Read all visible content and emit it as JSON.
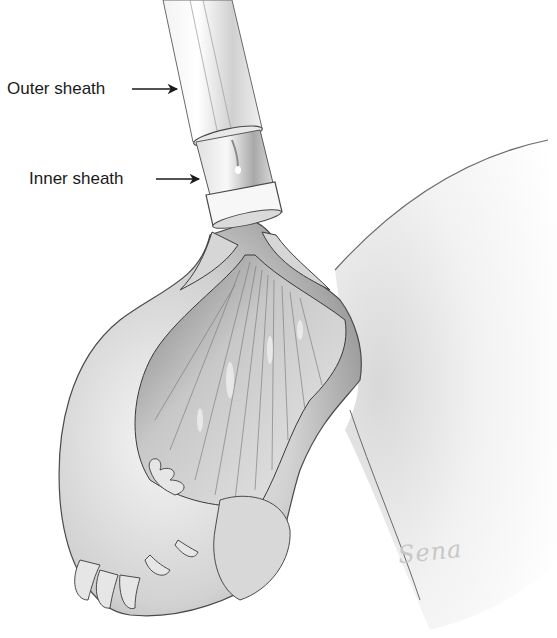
{
  "figure": {
    "labels": [
      {
        "id": "outer",
        "text": "Outer sheath",
        "x": 7,
        "y": 80,
        "arrow_from": [
          132,
          89
        ],
        "arrow_to": [
          177,
          89
        ]
      },
      {
        "id": "inner",
        "text": "Inner sheath",
        "x": 29,
        "y": 170,
        "arrow_from": [
          156,
          179
        ],
        "arrow_to": [
          199,
          179
        ]
      }
    ],
    "signature": "Sena",
    "colors": {
      "background": "#ffffff",
      "ink": "#1a1a1a",
      "shade_dark": "#8a8a8a",
      "shade_mid": "#c4c4c4",
      "shade_light": "#ececec"
    }
  }
}
